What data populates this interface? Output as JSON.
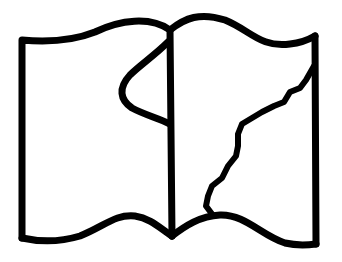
{
  "illustration": {
    "subject": "open-book-icon",
    "description": "Open book line drawing with a curved loop on the left page and a jagged tear/coastline on the right page",
    "colors": {
      "background": "#ffffff",
      "stroke": "#000000"
    },
    "stroke_width": 7
  }
}
